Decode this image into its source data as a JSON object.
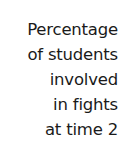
{
  "chart_data": {
    "type": "bar",
    "title": "",
    "ylabel": "Percentage of students involved in fights at time 2",
    "xlabel": "",
    "categories": [],
    "values": [],
    "annotations": [],
    "legend": [],
    "grid": false
  },
  "axis_label": {
    "full_text": "Percentage of students involved in fights at time 2",
    "alignment": "right",
    "text_color": "#1a1a1a",
    "background_color": "#ffffff",
    "lines": [
      {
        "text": "Percentage"
      },
      {
        "text": "of students"
      },
      {
        "text": "involved"
      },
      {
        "text": "in fights"
      },
      {
        "text": "at time 2"
      }
    ]
  }
}
